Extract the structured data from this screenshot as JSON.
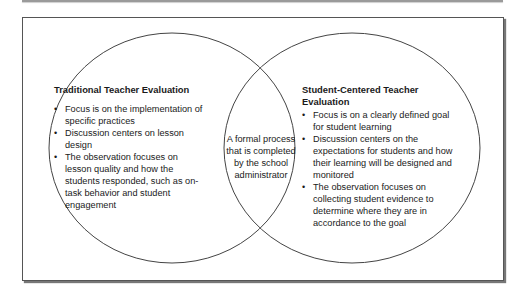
{
  "diagram": {
    "type": "venn",
    "colors": {
      "stroke": "#444444",
      "frame": "#555555",
      "background": "#ffffff",
      "text": "#1a1a1a"
    },
    "left_set": {
      "title": "Traditional Teacher Evaluation",
      "items": [
        "Focus is on the implementation of specific practices",
        "Discussion centers on lesson design",
        "The observation focuses on lesson quality and how the students responded, such as on-task behavior and student engagement"
      ]
    },
    "overlap": {
      "text": "A formal process that is completed by the school administrator"
    },
    "right_set": {
      "title": "Student-Centered Teacher Evaluation",
      "items": [
        "Focus is on a clearly defined goal for student learning",
        "Discussion centers on the expectations for students and how their learning will be designed and monitored",
        "The observation focuses on collecting student evidence to determine where they are in accordance to the goal"
      ]
    }
  }
}
